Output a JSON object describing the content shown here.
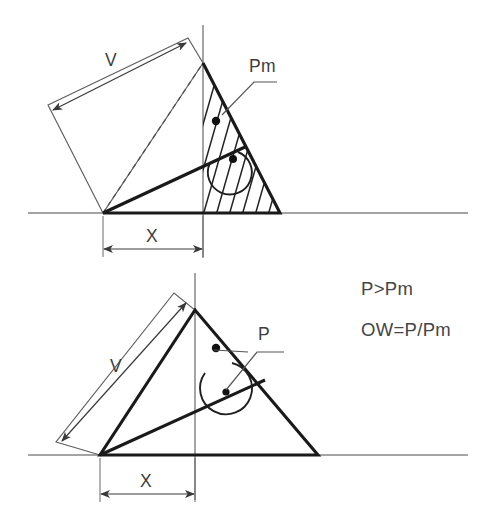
{
  "figure": {
    "background_color": "#ffffff",
    "line_color": "#1a1a1a",
    "thin_line_color": "#5e5e5e",
    "text_color": "#3d3d3d"
  },
  "upper_diagram": {
    "name": "upper-case-hatched",
    "labels": {
      "dimension_v": "V",
      "dimension_x": "X",
      "moment": "Pm"
    },
    "geometry": {
      "origin": [
        103,
        213
      ],
      "apex": [
        203,
        63
      ],
      "right_vertex": [
        280,
        213
      ],
      "inclined_line_end": [
        245,
        147
      ],
      "vertical_axis_x": 203,
      "baseline_y": 213
    }
  },
  "lower_diagram": {
    "name": "lower-case-plain",
    "labels": {
      "dimension_v": "V",
      "dimension_x": "X",
      "moment": "P"
    },
    "geometry": {
      "origin": [
        100,
        455
      ],
      "apex": [
        195,
        310
      ],
      "right_vertex": [
        318,
        455
      ],
      "vertical_axis_x": 195,
      "baseline_y": 455
    }
  },
  "notes": {
    "line1": "P>Pm",
    "line2": "OW=P/Pm"
  }
}
